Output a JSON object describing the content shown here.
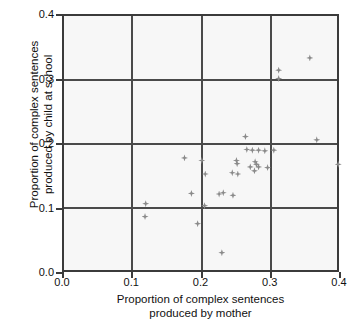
{
  "chart_data": {
    "type": "scatter",
    "title": "",
    "xlabel": "Proportion of complex sentences produced by mother",
    "xlabel_line1": "Proportion of complex sentences",
    "xlabel_line2": "produced by mother",
    "ylabel": "Proportion of complex sentences produced by child at school",
    "ylabel_line1": "Proportion of complex sentences",
    "ylabel_line2": "produced by child at school",
    "xlim": [
      0.0,
      0.4
    ],
    "ylim": [
      0.0,
      0.4
    ],
    "xticks": [
      0.0,
      0.1,
      0.2,
      0.3,
      0.4
    ],
    "yticks": [
      0.0,
      0.1,
      0.2,
      0.3,
      0.4
    ],
    "xtick_labels": [
      "0.0",
      "0.1",
      "0.2",
      "0.3",
      "0.4"
    ],
    "ytick_labels": [
      "0.0",
      "0.1",
      "0.2",
      "0.3",
      "0.4"
    ],
    "grid": true,
    "gridlines_x": [
      0.1,
      0.2,
      0.3
    ],
    "gridlines_y": [
      0.1,
      0.2,
      0.3
    ],
    "legend": false,
    "marker": "diamond",
    "marker_color": "#8a8a8a",
    "plot_background": "#f7f7f7",
    "frame_color": "#3b3b3b",
    "points": [
      {
        "x": 0.355,
        "y": 0.335
      },
      {
        "x": 0.31,
        "y": 0.316
      },
      {
        "x": 0.31,
        "y": 0.303
      },
      {
        "x": 0.262,
        "y": 0.213
      },
      {
        "x": 0.365,
        "y": 0.208
      },
      {
        "x": 0.303,
        "y": 0.192
      },
      {
        "x": 0.272,
        "y": 0.192
      },
      {
        "x": 0.281,
        "y": 0.192
      },
      {
        "x": 0.29,
        "y": 0.191
      },
      {
        "x": 0.264,
        "y": 0.193
      },
      {
        "x": 0.174,
        "y": 0.18
      },
      {
        "x": 0.249,
        "y": 0.176
      },
      {
        "x": 0.199,
        "y": 0.176
      },
      {
        "x": 0.25,
        "y": 0.171
      },
      {
        "x": 0.276,
        "y": 0.174
      },
      {
        "x": 0.278,
        "y": 0.17
      },
      {
        "x": 0.396,
        "y": 0.17
      },
      {
        "x": 0.269,
        "y": 0.166
      },
      {
        "x": 0.281,
        "y": 0.166
      },
      {
        "x": 0.294,
        "y": 0.165
      },
      {
        "x": 0.275,
        "y": 0.16
      },
      {
        "x": 0.243,
        "y": 0.157
      },
      {
        "x": 0.251,
        "y": 0.155
      },
      {
        "x": 0.204,
        "y": 0.155
      },
      {
        "x": 0.184,
        "y": 0.125
      },
      {
        "x": 0.23,
        "y": 0.126
      },
      {
        "x": 0.224,
        "y": 0.124
      },
      {
        "x": 0.244,
        "y": 0.122
      },
      {
        "x": 0.118,
        "y": 0.109
      },
      {
        "x": 0.203,
        "y": 0.106
      },
      {
        "x": 0.117,
        "y": 0.089
      },
      {
        "x": 0.193,
        "y": 0.078
      },
      {
        "x": 0.228,
        "y": 0.033
      }
    ]
  }
}
